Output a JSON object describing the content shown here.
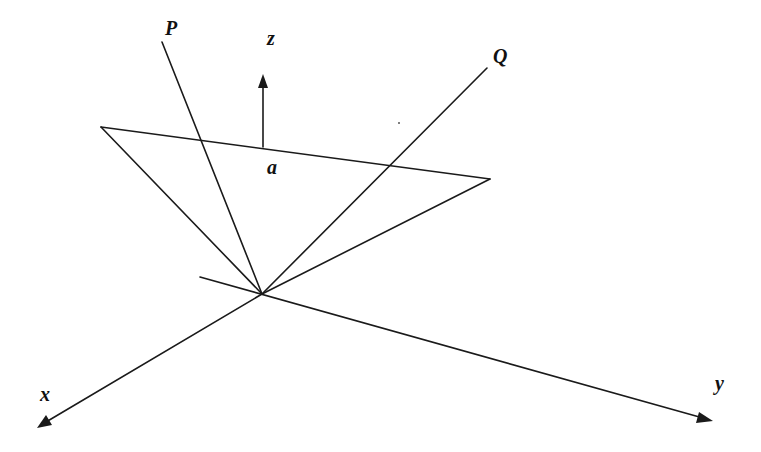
{
  "diagram": {
    "type": "3d-coordinate-geometry",
    "labels": {
      "P": "P",
      "Q": "Q",
      "z": "z",
      "a": "a",
      "x": "x",
      "y": "y"
    },
    "colors": {
      "stroke": "#1a1a1a",
      "background": "#ffffff"
    },
    "points": {
      "origin": [
        262,
        294
      ],
      "triangle_left": [
        101,
        127
      ],
      "triangle_right": [
        490,
        179
      ],
      "P_end": [
        162,
        42
      ],
      "Q_end": [
        487,
        68
      ],
      "normal_base": [
        263,
        147
      ],
      "normal_tip": [
        263,
        75
      ],
      "x_tip": [
        37,
        428
      ],
      "y_tip": [
        713,
        421
      ],
      "y_back": [
        200,
        277
      ]
    }
  }
}
